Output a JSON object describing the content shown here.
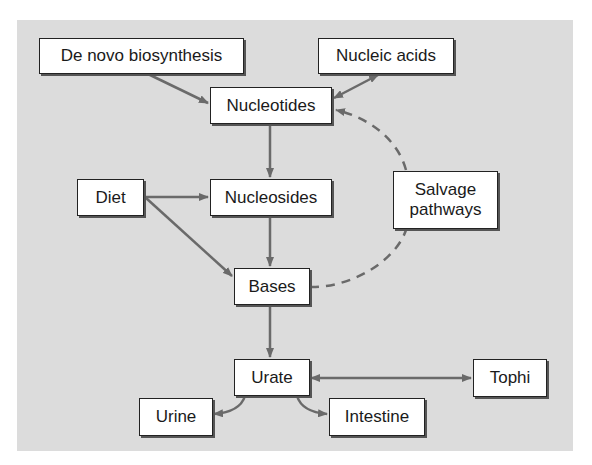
{
  "diagram": {
    "colors": {
      "background": "#dcdcdc",
      "box_fill": "#ffffff",
      "box_border": "#222222",
      "arrow": "#6a6a6a"
    },
    "nodes": {
      "de_novo": {
        "label": "De novo biosynthesis"
      },
      "nucleic_acids": {
        "label": "Nucleic acids"
      },
      "nucleotides": {
        "label": "Nucleotides"
      },
      "diet": {
        "label": "Diet"
      },
      "nucleosides": {
        "label": "Nucleosides"
      },
      "salvage": {
        "line1": "Salvage",
        "line2": "pathways"
      },
      "bases": {
        "label": "Bases"
      },
      "urate": {
        "label": "Urate"
      },
      "tophi": {
        "label": "Tophi"
      },
      "urine": {
        "label": "Urine"
      },
      "intestine": {
        "label": "Intestine"
      }
    },
    "edges": [
      {
        "from": "De novo biosynthesis",
        "to": "Nucleotides",
        "style": "solid",
        "direction": "forward"
      },
      {
        "from": "Nucleotides",
        "to": "Nucleic acids",
        "style": "solid",
        "direction": "bidirectional"
      },
      {
        "from": "Nucleotides",
        "to": "Nucleosides",
        "style": "solid",
        "direction": "forward"
      },
      {
        "from": "Diet",
        "to": "Nucleosides",
        "style": "solid",
        "direction": "forward"
      },
      {
        "from": "Diet",
        "to": "Bases",
        "style": "solid",
        "direction": "forward"
      },
      {
        "from": "Nucleosides",
        "to": "Bases",
        "style": "solid",
        "direction": "forward"
      },
      {
        "from": "Bases",
        "to": "Salvage pathways",
        "style": "dashed",
        "direction": "none"
      },
      {
        "from": "Salvage pathways",
        "to": "Nucleotides",
        "style": "dashed",
        "direction": "forward"
      },
      {
        "from": "Bases",
        "to": "Urate",
        "style": "solid",
        "direction": "forward"
      },
      {
        "from": "Urate",
        "to": "Tophi",
        "style": "solid",
        "direction": "bidirectional"
      },
      {
        "from": "Urate",
        "to": "Urine",
        "style": "solid",
        "direction": "forward"
      },
      {
        "from": "Urate",
        "to": "Intestine",
        "style": "solid",
        "direction": "forward"
      }
    ]
  }
}
